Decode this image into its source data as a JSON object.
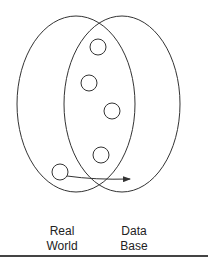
{
  "diagram": {
    "sets": [
      {
        "name": "real-world",
        "label_line1": "Real",
        "label_line2": "World"
      },
      {
        "name": "data-base",
        "label_line1": "Data",
        "label_line2": "Base"
      }
    ],
    "elements_count": 5,
    "arrow": "from real-world element to data-base",
    "stroke_color": "#333333"
  }
}
